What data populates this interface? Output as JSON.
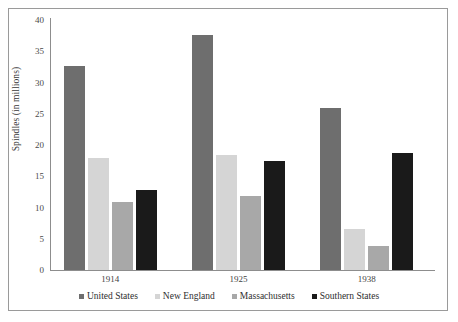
{
  "chart_data": {
    "type": "bar",
    "title": "",
    "subtitle": "",
    "xlabel": "",
    "ylabel": "Spindles (in millions)",
    "categories": [
      "1914",
      "1925",
      "1938"
    ],
    "series": [
      {
        "name": "United States",
        "color": "#6e6e6e",
        "values": [
          32.6,
          37.6,
          26.0
        ]
      },
      {
        "name": "New England",
        "color": "#d5d5d5",
        "values": [
          17.9,
          18.4,
          6.6
        ]
      },
      {
        "name": "Massachusetts",
        "color": "#a8a8a8",
        "values": [
          10.9,
          11.8,
          3.8
        ]
      },
      {
        "name": "Southern States",
        "color": "#1a1a1a",
        "values": [
          12.8,
          17.5,
          18.7
        ]
      }
    ],
    "ylim": [
      0,
      40
    ],
    "yticks": [
      "0",
      "5",
      "10",
      "15",
      "20",
      "25",
      "30",
      "35",
      "40"
    ],
    "grid": false,
    "legend_position": "bottom",
    "frame": true,
    "axis_color": "#8d8d8d"
  }
}
